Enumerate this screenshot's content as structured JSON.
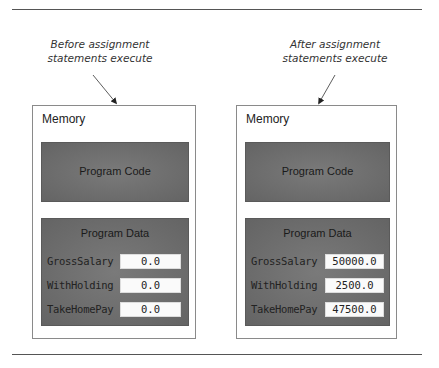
{
  "figure": {
    "before": {
      "caption_line1": "Before assignment",
      "caption_line2": "statements execute",
      "memory_label": "Memory",
      "code_label": "Program Code",
      "data_label": "Program Data",
      "variables": [
        {
          "name": "GrossSalary",
          "value": "0.0"
        },
        {
          "name": "WithHolding",
          "value": "0.0"
        },
        {
          "name": "TakeHomePay",
          "value": "0.0"
        }
      ]
    },
    "after": {
      "caption_line1": "After assignment",
      "caption_line2": "statements execute",
      "memory_label": "Memory",
      "code_label": "Program Code",
      "data_label": "Program Data",
      "variables": [
        {
          "name": "GrossSalary",
          "value": "50000.0"
        },
        {
          "name": "WithHolding",
          "value": "2500.0"
        },
        {
          "name": "TakeHomePay",
          "value": "47500.0"
        }
      ]
    }
  },
  "colors": {
    "panel": "#6f6f6f",
    "value_box": "#fafafa",
    "rule": "#555555"
  }
}
